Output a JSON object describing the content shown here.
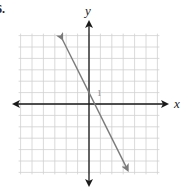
{
  "problem": {
    "number": "6."
  },
  "graph": {
    "x_label": "x",
    "y_label": "y",
    "tick_label": "1",
    "grid": {
      "xmin": -6,
      "xmax": 6,
      "ymin": -6,
      "ymax": 6,
      "step": 1
    },
    "colors": {
      "axis": "#1a1a1a",
      "grid": "#d0d0d0",
      "line": "#7a7a7a"
    }
  },
  "chart_data": {
    "type": "line",
    "title": "",
    "xlabel": "x",
    "ylabel": "y",
    "equation": "y = -2x + 1",
    "slope": -2,
    "y_intercept": 1,
    "x_intercept": 0.5,
    "xlim": [
      -6,
      6
    ],
    "ylim": [
      -6,
      6
    ],
    "grid": true,
    "annotations": [
      "1"
    ],
    "series": [
      {
        "name": "line",
        "x": [
          -2.35,
          3.4
        ],
        "y": [
          5.7,
          -5.8
        ],
        "arrows": "both"
      }
    ]
  }
}
